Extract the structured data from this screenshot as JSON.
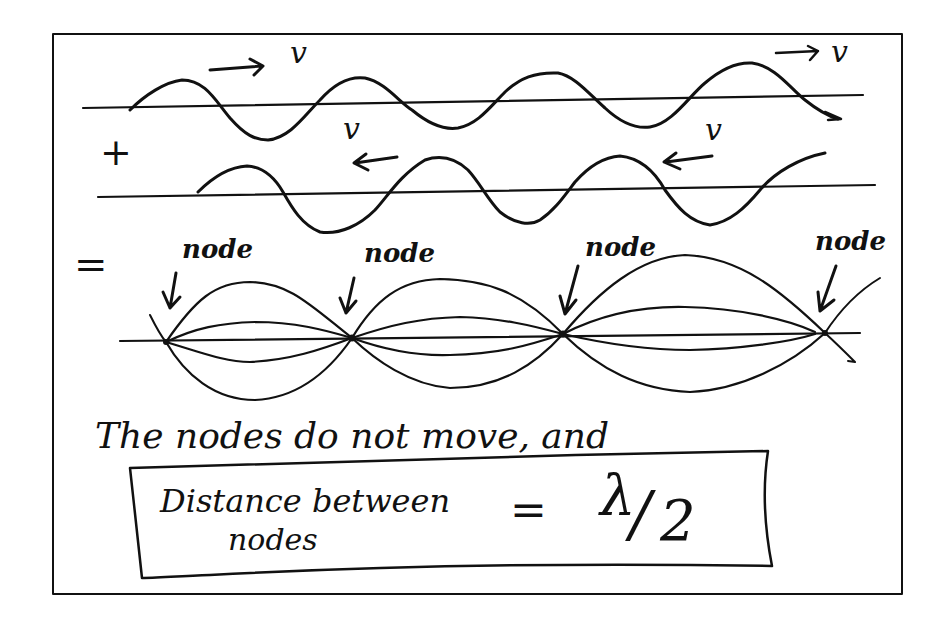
{
  "diagram": {
    "colors": {
      "ink": "#111111",
      "paper": "#ffffff"
    },
    "wave_right": {
      "label": "v",
      "direction": "right",
      "arrow_glyph": "→"
    },
    "wave_left": {
      "label": "v",
      "direction": "left",
      "arrow_glyph": "←"
    },
    "operators": {
      "plus": "+",
      "equals": "="
    },
    "standing_wave": {
      "node_labels": [
        "node",
        "node",
        "node",
        "node"
      ],
      "node_count": 4,
      "loop_count": 3
    },
    "caption": "The nodes do not move, and",
    "boxed_formula": {
      "lhs_line1": "Distance between",
      "lhs_line2": "nodes",
      "equals": "=",
      "rhs_numerator": "λ",
      "rhs_slash": "/",
      "rhs_denominator": "2"
    }
  }
}
